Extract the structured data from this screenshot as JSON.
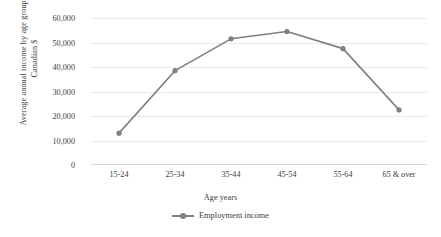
{
  "chart_data": {
    "type": "line",
    "title": "",
    "categories": [
      "15-24",
      "25-34",
      "35-44",
      "45-54",
      "55-64",
      "65 & over"
    ],
    "series": [
      {
        "name": "Employment income",
        "values": [
          13000,
          38500,
          51500,
          54500,
          47500,
          22500
        ],
        "color": "#7f7f7f"
      }
    ],
    "xlabel": "Age years",
    "ylabel_line1": "Average annual income by age group in",
    "ylabel_line2": "Canadian $",
    "ylim": [
      0,
      60000
    ],
    "ytick_values": [
      0,
      10000,
      20000,
      30000,
      40000,
      50000,
      60000
    ],
    "ytick_labels": [
      "0",
      "10,000",
      "20,000",
      "30,000",
      "40,000",
      "50,000",
      "60,000"
    ],
    "grid": true,
    "legend_position": "bottom",
    "marker": "circle",
    "line_color": "#7f7f7f",
    "grid_color": "#e9e9e9"
  }
}
